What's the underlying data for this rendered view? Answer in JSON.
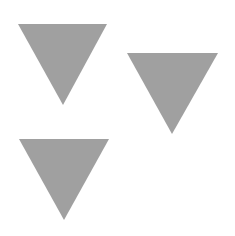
{
  "canvas": {
    "width": 235,
    "height": 236,
    "background": "#ffffff"
  },
  "shapes": [
    {
      "type": "triangle-down",
      "color": "#a0a0a0",
      "points": "18,24 107,24 63,105"
    },
    {
      "type": "triangle-down",
      "color": "#a0a0a0",
      "points": "127,53 218,53 172,134"
    },
    {
      "type": "triangle-down",
      "color": "#a0a0a0",
      "points": "19,139 109,139 64,220"
    }
  ]
}
